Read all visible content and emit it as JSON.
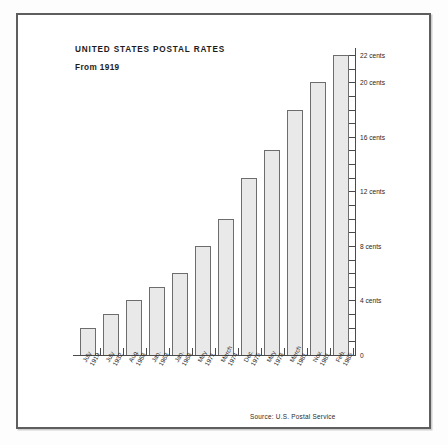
{
  "frame": {
    "border_color": "#5e5e5e",
    "background": "#ffffff"
  },
  "header": {
    "title": "UNITED STATES POSTAL RATES",
    "subtitle": "From 1919"
  },
  "footer": {
    "source": "Source: U.S. Postal Service"
  },
  "style": {
    "bar_fill": "#e9e9e9",
    "bar_stroke": "#6d6d6d",
    "axis_color": "#4a4a4a",
    "text_color": "#1c1c1c"
  },
  "chart_data": {
    "type": "bar",
    "title": "UNITED STATES POSTAL RATES",
    "subtitle": "From 1919",
    "xlabel": "",
    "ylabel": "",
    "ylim": [
      0,
      22
    ],
    "grid": false,
    "legend": "none",
    "axis_position": "right",
    "unit": "cents",
    "categories": [
      "July 1919",
      "July 1932",
      "Aug. 1958",
      "Jan. 1963",
      "Jan. 1968",
      "May 1971",
      "March 1974",
      "Dec. 1975",
      "May 1978",
      "March 1981",
      "Nov. 1981",
      "Feb. 1985"
    ],
    "category_months": [
      "July",
      "July",
      "Aug.",
      "Jan.",
      "Jan.",
      "May",
      "March",
      "Dec.",
      "May",
      "March",
      "Nov.",
      "Feb."
    ],
    "category_years": [
      "1919",
      "1932",
      "1958",
      "1963",
      "1968",
      "1971",
      "1974",
      "1975",
      "1978",
      "1981",
      "1981",
      "1985"
    ],
    "values": [
      2,
      3,
      4,
      5,
      6,
      8,
      10,
      13,
      15,
      18,
      20,
      22
    ],
    "ytick_values": [
      0,
      1,
      2,
      3,
      4,
      5,
      6,
      7,
      8,
      9,
      10,
      11,
      12,
      13,
      14,
      15,
      16,
      17,
      18,
      19,
      20,
      21,
      22
    ],
    "ytick_labeled": [
      {
        "value": 0,
        "label": "0"
      },
      {
        "value": 4,
        "label": "4 cents"
      },
      {
        "value": 8,
        "label": "8 cents"
      },
      {
        "value": 12,
        "label": "12 cents"
      },
      {
        "value": 16,
        "label": "16 cents"
      },
      {
        "value": 20,
        "label": "20 cents"
      },
      {
        "value": 22,
        "label": "22 cents"
      }
    ],
    "source": "Source: U.S. Postal Service"
  }
}
